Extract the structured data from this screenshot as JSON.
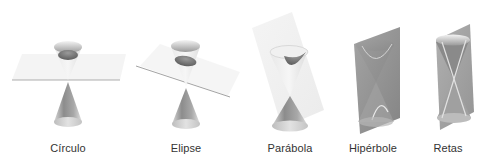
{
  "figure": {
    "panels": [
      {
        "id": "circulo",
        "label": "Círculo",
        "plane": "horizontal"
      },
      {
        "id": "elipse",
        "label": "Elipse",
        "plane": "tilted"
      },
      {
        "id": "parabola",
        "label": "Parábola",
        "plane": "parallel-to-generatrix"
      },
      {
        "id": "hiperbole",
        "label": "Hipérbole",
        "plane": "vertical"
      },
      {
        "id": "retas",
        "label": "Retas",
        "plane": "through-vertex"
      }
    ],
    "colors": {
      "cone_light": "#e6e6e6",
      "cone_mid": "#b0b0b0",
      "cone_dark": "#6e6e6e",
      "plane_light": "#f0f0f0",
      "plane_dark": "#8a8a8a",
      "edge": "#9a9a9a",
      "label": "#333333"
    }
  }
}
